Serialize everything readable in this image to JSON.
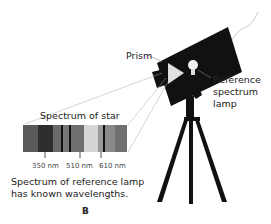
{
  "labels": {
    "prism": "Prism",
    "reference_lamp": [
      "Reference",
      "spectrum",
      "lamp"
    ],
    "spectrum_of_star": "Spectrum of star",
    "caption_line1": "Spectrum of reference lamp",
    "caption_line2": "has known wavelengths.",
    "figure_letter": "B"
  },
  "wavelengths": [
    {
      "label": "350 nm",
      "x": 45
    },
    {
      "label": "510 nm",
      "x": 80
    },
    {
      "label": "610 nm",
      "x": 101
    }
  ],
  "spectrum_bands": [
    {
      "color": "#5a5a5a",
      "width": 15
    },
    {
      "color": "#2e2e2e",
      "width": 15
    },
    {
      "color": "#6a6a6a",
      "width": 8
    },
    {
      "color": "#111111",
      "width": 2
    },
    {
      "color": "#777777",
      "width": 6
    },
    {
      "color": "#111111",
      "width": 2
    },
    {
      "color": "#6e6e6e",
      "width": 13
    },
    {
      "color": "#d6d6d6",
      "width": 14
    },
    {
      "color": "#9a9a9a",
      "width": 5
    },
    {
      "color": "#111111",
      "width": 2
    },
    {
      "color": "#8a8a8a",
      "width": 10
    },
    {
      "color": "#707070",
      "width": 12
    }
  ]
}
